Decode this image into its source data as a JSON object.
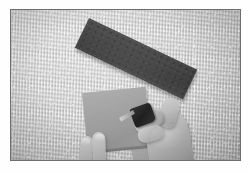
{
  "image": {
    "kind": "photograph",
    "medium": "black-and-white print with white border",
    "width_px": 250,
    "height_px": 174,
    "print_area": {
      "x": 11,
      "y": 10,
      "width": 229,
      "height": 150
    },
    "border_color": "#fefefe",
    "print_border_line_color": "#6e6e6e",
    "scene_description": "Two hands working on a light gray square sheet laid on a textured light carpet, with a dark abrasive strip placed diagonally above"
  },
  "palette": {
    "paper_white": "#fefefe",
    "carpet_light": "#dedede",
    "carpet_mid": "#c2c2c2",
    "carpet_dark": "#b2b2b2",
    "dark_strip": "#434343",
    "gray_square": "#9e9e9e",
    "skin_light": "#d6cdc4",
    "skin_mid": "#b8ada2",
    "skin_shadow": "#9d9287",
    "tool_black": "#1d1d1d",
    "metal_tip": "#cfcfcf"
  },
  "objects": [
    {
      "name": "dark-strip",
      "label": "Dark abrasive strip",
      "shape": "rectangle",
      "rotation_deg": 25.5,
      "position": {
        "x": 78,
        "y": 8
      },
      "size": {
        "width": 120,
        "height": 33
      },
      "color": "#434343"
    },
    {
      "name": "gray-square",
      "label": "Gray square sheet",
      "shape": "square",
      "rotation_deg": -5.5,
      "position": {
        "x": 71,
        "y": 83
      },
      "size": {
        "width": 64,
        "height": 59
      },
      "color": "#9e9e9e"
    },
    {
      "name": "sheet-sliver",
      "label": "Second sheet edge",
      "shape": "rectangle",
      "rotation_deg": -8,
      "position": {
        "x": 118,
        "y": 122
      },
      "size": {
        "width": 60,
        "height": 30
      },
      "color": "#a6a6a6"
    },
    {
      "name": "right-hand",
      "label": "Right hand holding tool",
      "position": {
        "x": 128,
        "y": 84
      },
      "size": {
        "width": 62,
        "height": 78
      },
      "color": "#b8ada2"
    },
    {
      "name": "tool",
      "label": "Small dark hand tool",
      "position": {
        "x": 129,
        "y": 92
      },
      "size": {
        "width": 22,
        "height": 20
      },
      "color": "#1d1d1d"
    },
    {
      "name": "left-hand",
      "label": "Left hand fingers steadying the sheet",
      "position": {
        "x": 62,
        "y": 120
      },
      "size": {
        "width": 48,
        "height": 56
      },
      "color": "#c3b9ae"
    }
  ],
  "text": {
    "visible_text": "",
    "note": "No text, labels, captions, or UI chrome appear anywhere in this photograph"
  }
}
